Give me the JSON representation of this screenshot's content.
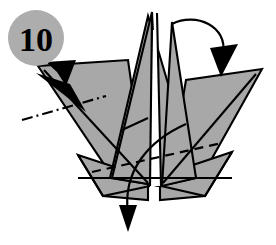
{
  "diagram": {
    "step_badge": {
      "number": "10",
      "shape": "circle",
      "fill_color": "#adadad",
      "text_color": "#000000"
    },
    "colors": {
      "paper_fill": "#a8a8a8",
      "paper_outline": "#000000",
      "background": "#ffffff",
      "badge_fill": "#adadad"
    },
    "model": {
      "description": "Crane-like origami base with two central peaks and two side wings",
      "faces": [
        {
          "name": "left-wing",
          "fill": "#a8a8a8"
        },
        {
          "name": "right-wing",
          "fill": "#a8a8a8"
        },
        {
          "name": "center-left-peak",
          "fill": "#a8a8a8"
        },
        {
          "name": "center-right-peak",
          "fill": "#a8a8a8"
        },
        {
          "name": "lower-left-base",
          "fill": "#a8a8a8"
        },
        {
          "name": "lower-right-base",
          "fill": "#a8a8a8"
        }
      ]
    },
    "creases": [
      {
        "name": "mountain-fold-left",
        "style": "dash-dot",
        "label": "mountain fold (dash-dot line) across left wing"
      },
      {
        "name": "valley-fold-lower-right",
        "style": "dashed",
        "label": "valley fold (dashed line) across lower body"
      }
    ],
    "arrows": [
      {
        "name": "push-arrow-left",
        "style": "solid-filled-triangle",
        "direction": "up-right",
        "label": "push / reverse fold left wing tip"
      },
      {
        "name": "fold-arrow-top-right",
        "style": "curved",
        "direction": "over-to-the-right",
        "label": "fold top peak over to the right"
      },
      {
        "name": "fold-arrow-bottom",
        "style": "curved",
        "direction": "down",
        "label": "bring flap down"
      }
    ]
  }
}
